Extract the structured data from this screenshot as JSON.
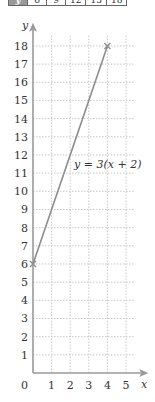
{
  "table": {
    "row_label": "y",
    "values": [
      "6",
      "9",
      "12",
      "15",
      "18"
    ]
  },
  "chart_data": {
    "type": "line",
    "title": "",
    "xlabel": "x",
    "ylabel": "y",
    "equation_label": "y = 3(x + 2)",
    "x_ticks": [
      0,
      1,
      2,
      3,
      4,
      5
    ],
    "y_ticks": [
      1,
      2,
      3,
      4,
      5,
      6,
      7,
      8,
      9,
      10,
      11,
      12,
      13,
      14,
      15,
      16,
      17,
      18
    ],
    "xlim": [
      0,
      5.5
    ],
    "ylim": [
      0,
      19
    ],
    "grid": true,
    "series": [
      {
        "name": "y = 3(x + 2)",
        "points": [
          [
            0,
            6
          ],
          [
            4,
            18
          ]
        ]
      }
    ],
    "colors": {
      "axis": "#9a9a9a",
      "line": "#8c8c8c",
      "grid": "#c8c8c8",
      "text": "#333333"
    }
  }
}
